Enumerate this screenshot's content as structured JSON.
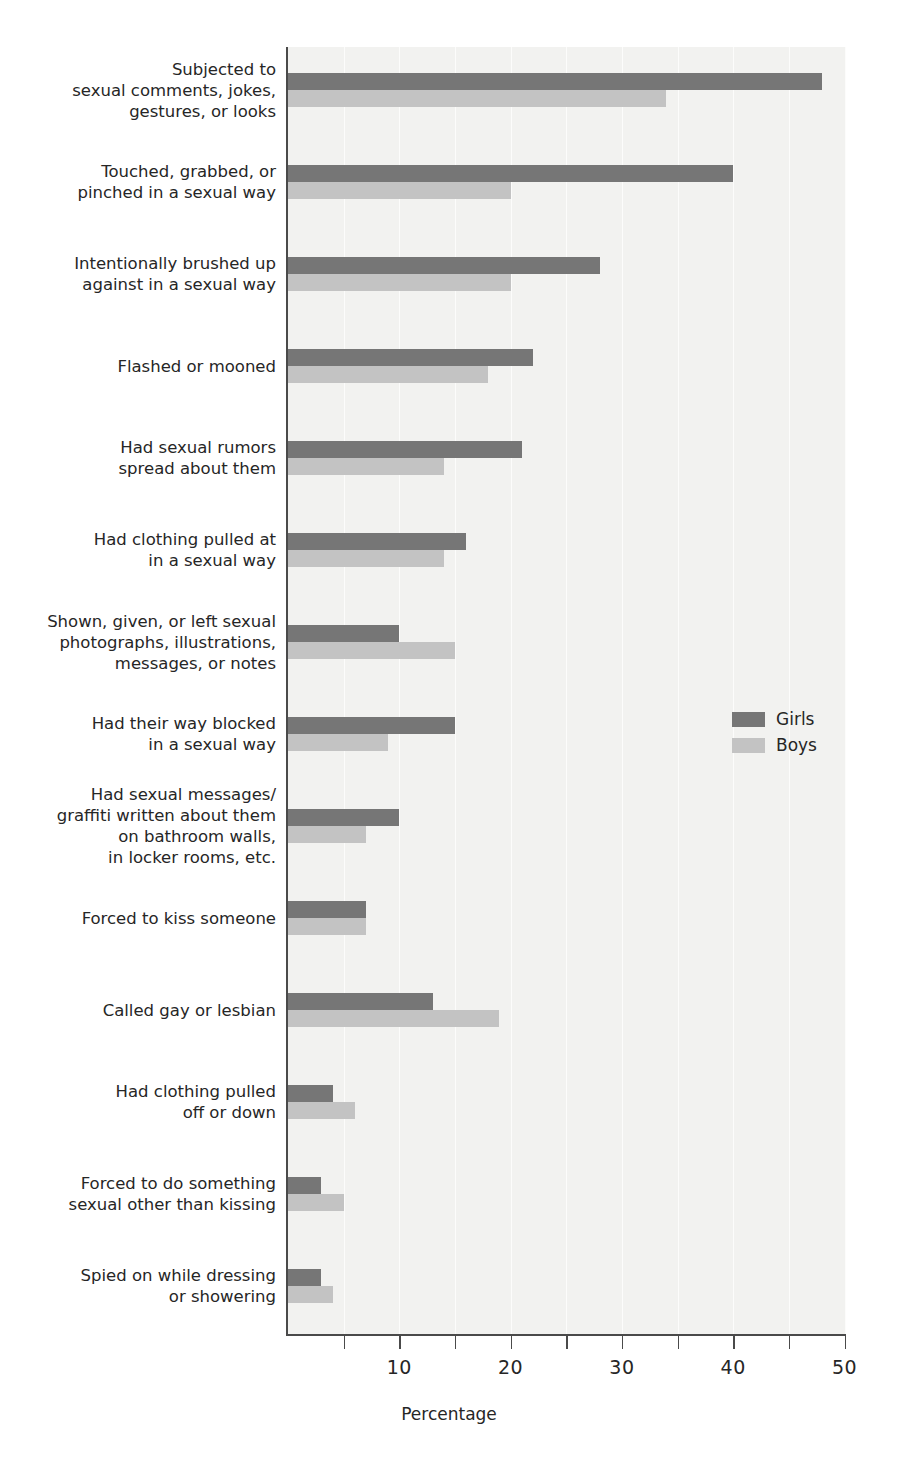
{
  "chart_data": {
    "type": "bar",
    "orientation": "horizontal",
    "title": "",
    "xlabel": "Percentage",
    "ylabel": "",
    "xlim": [
      0,
      50
    ],
    "xticks": [
      0,
      5,
      10,
      15,
      20,
      25,
      30,
      35,
      40,
      45,
      50
    ],
    "xtick_labels": [
      "",
      "",
      "10",
      "",
      "20",
      "",
      "30",
      "",
      "40",
      "",
      "50"
    ],
    "grid": true,
    "legend_position": "middle-right",
    "categories": [
      "Subjected to\nsexual comments, jokes,\ngestures, or looks",
      "Touched, grabbed, or\npinched in a sexual way",
      "Intentionally brushed up\nagainst in a sexual way",
      "Flashed or mooned",
      "Had sexual rumors\nspread about them",
      "Had clothing pulled at\nin a sexual way",
      "Shown, given, or left sexual\nphotographs, illustrations,\nmessages, or notes",
      "Had their way blocked\nin a sexual way",
      "Had sexual messages/\ngraffiti written about them\non bathroom walls,\nin locker rooms, etc.",
      "Forced to kiss someone",
      "Called gay or lesbian",
      "Had clothing pulled\noff or down",
      "Forced to do something\nsexual other than kissing",
      "Spied on while dressing\nor showering"
    ],
    "series": [
      {
        "name": "Girls",
        "color": "#767676",
        "values": [
          48,
          40,
          28,
          22,
          21,
          16,
          10,
          15,
          10,
          7,
          13,
          4,
          3,
          3
        ]
      },
      {
        "name": "Boys",
        "color": "#c3c3c3",
        "values": [
          34,
          20,
          20,
          18,
          14,
          14,
          15,
          9,
          7,
          7,
          19,
          6,
          5,
          4
        ]
      }
    ]
  },
  "legend": {
    "items": [
      {
        "label": "Girls"
      },
      {
        "label": "Boys"
      }
    ]
  },
  "axis": {
    "x_title": "Percentage"
  }
}
